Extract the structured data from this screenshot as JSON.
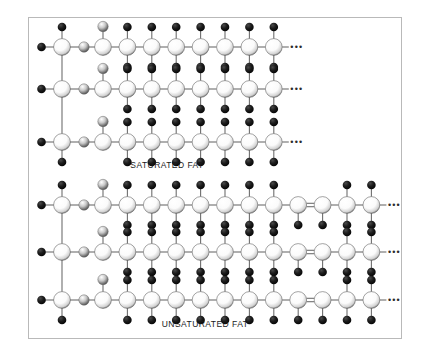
{
  "figure": {
    "background_color": "#ffffff",
    "frame_color": "#b9b9b9",
    "bond_color": "#6e6e6e",
    "carbon_color": "#f2f2f2",
    "hydrogen_color": "#0d0d0d",
    "oxygen_color": "#9a9a9a",
    "ellipsis_glyph": "•••"
  },
  "captions": [
    {
      "id": "saturated-fat-caption",
      "text": "SATURATED FAT",
      "x": 167,
      "y": 166
    },
    {
      "id": "unsaturated-fat-caption",
      "text": "UNSATURATED FAT",
      "x": 205,
      "y": 325
    }
  ],
  "chart_data": {
    "type": "diagram",
    "molecules": [
      {
        "name": "SATURATED FAT",
        "description": "Triglyceride with three fully saturated fatty acid chains; every carbon in the chain carries two hydrogens and all carbon-carbon bonds are single bonds.",
        "chains": 3,
        "chain_carbons": 8,
        "double_bonds": 0,
        "bond_type": "all single",
        "label": "SATURATED FAT"
      },
      {
        "name": "UNSATURATED FAT",
        "description": "Triglyceride with three fatty acid chains each containing one carbon-carbon double bond; the doubly bonded carbons carry only one hydrogen each.",
        "chains": 3,
        "chain_carbons": 12,
        "double_bonds": 1,
        "bond_type": "one double bond per chain",
        "label": "UNSATURATED FAT"
      }
    ],
    "atoms_legend": [
      {
        "symbol": "C",
        "name": "carbon",
        "rendering": "large light sphere"
      },
      {
        "symbol": "H",
        "name": "hydrogen",
        "rendering": "small black sphere"
      },
      {
        "symbol": "O",
        "name": "oxygen",
        "rendering": "small grey sphere"
      }
    ]
  },
  "geometry": {
    "saturated": {
      "rows_y": [
        47,
        89,
        142
      ],
      "glycerol_x": 62,
      "oxygen_x": 84,
      "first_chain_x": 103,
      "chain_step": 24.4,
      "chain_count": 8,
      "ellipsis_x": 266
    },
    "unsaturated": {
      "rows_y": [
        205,
        252,
        300
      ],
      "glycerol_x": 62,
      "oxygen_x": 84,
      "first_chain_x": 103,
      "chain_step": 24.4,
      "chain_count": 12,
      "double_bond_index": 9,
      "ellipsis_x": 374
    }
  }
}
